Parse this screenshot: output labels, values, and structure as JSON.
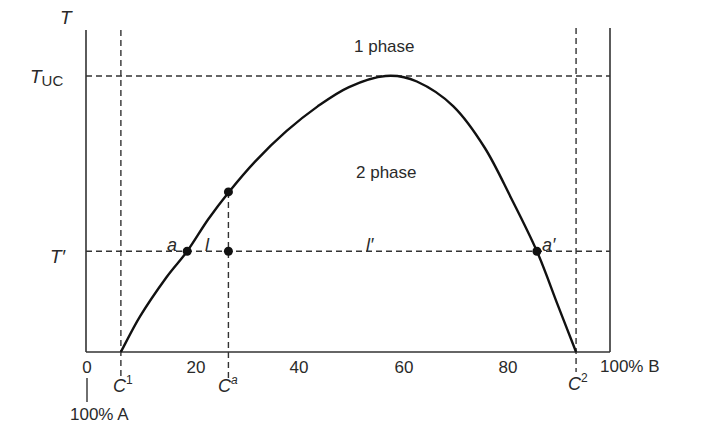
{
  "chart_data": {
    "type": "line",
    "title": "",
    "xlabel_left": "100% A",
    "xlabel_right": "100% B",
    "ylabel": "T",
    "xlim": [
      0,
      100
    ],
    "x_ticks": [
      {
        "value": 0,
        "label": "0"
      },
      {
        "value": 20,
        "label": "20"
      },
      {
        "value": 40,
        "label": "40"
      },
      {
        "value": 60,
        "label": "60"
      },
      {
        "value": 80,
        "label": "80"
      }
    ],
    "y_levels": {
      "T_UC": {
        "label": "T",
        "sub": "UC",
        "value": 1.0
      },
      "T_prime": {
        "label": "T′",
        "value": 0.365
      }
    },
    "regions": [
      {
        "label": "1 phase",
        "x": 57,
        "y": 1.13
      },
      {
        "label": "2 phase",
        "x": 57,
        "y": 0.65
      }
    ],
    "series": [
      {
        "name": "coexistence curve",
        "points": [
          [
            6.3,
            0.0
          ],
          [
            10,
            0.13
          ],
          [
            15,
            0.27
          ],
          [
            19,
            0.365
          ],
          [
            23,
            0.48
          ],
          [
            27,
            0.58
          ],
          [
            32,
            0.69
          ],
          [
            38,
            0.8
          ],
          [
            44,
            0.89
          ],
          [
            50,
            0.96
          ],
          [
            57,
            1.0
          ],
          [
            63,
            0.98
          ],
          [
            70,
            0.89
          ],
          [
            76,
            0.74
          ],
          [
            81,
            0.56
          ],
          [
            86,
            0.365
          ],
          [
            90,
            0.17
          ],
          [
            93.5,
            0.0
          ]
        ]
      }
    ],
    "reference_lines": {
      "vertical": [
        {
          "name": "C1",
          "label": "C",
          "sup": "1",
          "x": 6.3
        },
        {
          "name": "Ca",
          "label": "C",
          "sup": "a",
          "x": 26.9
        },
        {
          "name": "C2",
          "label": "C",
          "sup": "2",
          "x": 93.5
        }
      ]
    },
    "points": [
      {
        "name": "a",
        "label": "a",
        "x": 19,
        "y": 0.365
      },
      {
        "name": "curve-at-Ca",
        "label": "",
        "x": 26.9,
        "y": 0.58
      },
      {
        "name": "overall-composition",
        "label": "",
        "x": 26.9,
        "y": 0.365
      },
      {
        "name": "a-prime",
        "label": "a′",
        "x": 86,
        "y": 0.365
      }
    ],
    "segment_labels": [
      {
        "label": "l",
        "x": 23,
        "y": 0.365
      },
      {
        "label": "l′",
        "x": 54,
        "y": 0.365
      }
    ],
    "grid": false
  }
}
